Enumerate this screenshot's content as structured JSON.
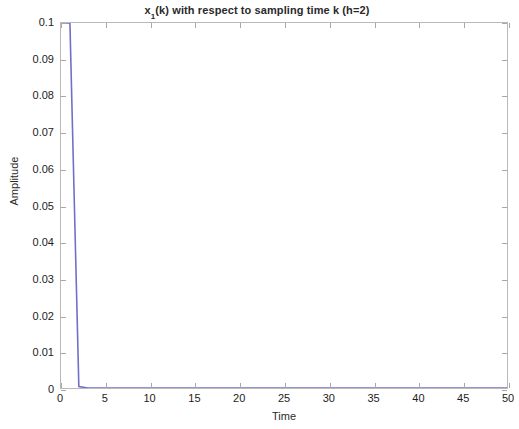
{
  "chart_data": {
    "type": "line",
    "title_base": "x",
    "title_subscript": "1",
    "title_rest": "(k) with respect to sampling time k (h=2)",
    "xlabel": "Time",
    "ylabel": "Amplitude",
    "xlim": [
      0,
      50
    ],
    "ylim": [
      0,
      0.1
    ],
    "grid": false,
    "legend": null,
    "legend_position": "none",
    "line_color": "#7070c8",
    "axis_color": "#b9b9b9",
    "background_color": "#ffffff",
    "xticks": [
      0,
      5,
      10,
      15,
      20,
      25,
      30,
      35,
      40,
      45,
      50
    ],
    "xtick_labels": [
      "0",
      "5",
      "10",
      "15",
      "20",
      "25",
      "30",
      "35",
      "40",
      "45",
      "50"
    ],
    "yticks": [
      0,
      0.01,
      0.02,
      0.03,
      0.04,
      0.05,
      0.06,
      0.07,
      0.08,
      0.09,
      0.1
    ],
    "ytick_labels": [
      "0",
      "0.01",
      "0.02",
      "0.03",
      "0.04",
      "0.05",
      "0.06",
      "0.07",
      "0.08",
      "0.09",
      "0.1"
    ],
    "series": [
      {
        "name": "x1(k)",
        "color": "#7070c8",
        "x": [
          0,
          1,
          2,
          3,
          4,
          5,
          6,
          7,
          8,
          9,
          10,
          11,
          12,
          13,
          14,
          15,
          16,
          17,
          18,
          19,
          20,
          21,
          22,
          23,
          24,
          25,
          26,
          27,
          28,
          29,
          30,
          31,
          32,
          33,
          34,
          35,
          36,
          37,
          38,
          39,
          40,
          41,
          42,
          43,
          44,
          45,
          46,
          47,
          48,
          49,
          50
        ],
        "values": [
          0.1,
          0.1,
          0.0004,
          0.0,
          0.0,
          0.0,
          0.0,
          0.0,
          0.0,
          0.0,
          0.0,
          0.0,
          0.0,
          0.0,
          0.0,
          0.0,
          0.0,
          0.0,
          0.0,
          0.0,
          0.0,
          0.0,
          0.0,
          0.0,
          0.0,
          0.0,
          0.0,
          0.0,
          0.0,
          0.0,
          0.0,
          0.0,
          0.0,
          0.0,
          0.0,
          0.0,
          0.0,
          0.0,
          0.0,
          0.0,
          0.0,
          0.0,
          0.0,
          0.0,
          0.0,
          0.0,
          0.0,
          0.0,
          0.0,
          0.0,
          0.0
        ]
      }
    ]
  }
}
